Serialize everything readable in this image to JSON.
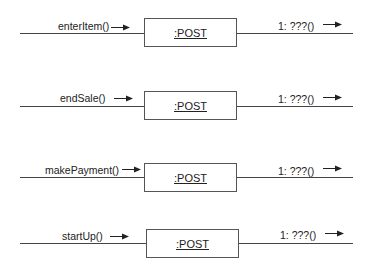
{
  "diagram": {
    "type": "UML collaboration diagrams",
    "rows": [
      {
        "incoming": "enterItem()",
        "object": ":POST",
        "outgoing": "1: ???()"
      },
      {
        "incoming": "endSale()",
        "object": ":POST",
        "outgoing": "1: ???()"
      },
      {
        "incoming": "makePayment()",
        "object": ":POST",
        "outgoing": "1: ???()"
      },
      {
        "incoming": "startUp()",
        "object": ":POST",
        "outgoing": "1: ???()"
      }
    ],
    "colors": {
      "line": "#444444",
      "box_border": "#555555",
      "text": "#222222"
    }
  }
}
